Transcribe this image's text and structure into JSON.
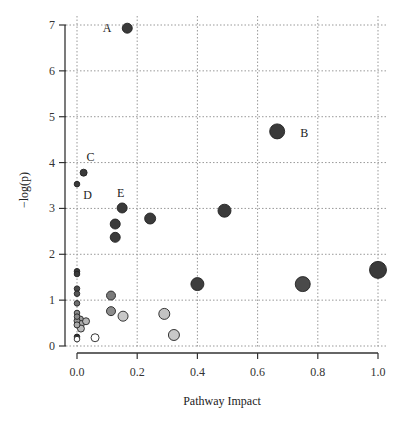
{
  "chart_data": {
    "type": "scatter",
    "title": "",
    "xlabel": "Pathway Impact",
    "ylabel": "−log(p)",
    "xlim": [
      0.0,
      1.0
    ],
    "ylim": [
      0,
      7
    ],
    "xticks": [
      "0.0",
      "0.2",
      "0.4",
      "0.6",
      "0.8",
      "1.0"
    ],
    "yticks": [
      "0",
      "1",
      "2",
      "3",
      "4",
      "5",
      "6",
      "7"
    ],
    "grid": true,
    "legend": null,
    "points": [
      {
        "x": 0.167,
        "y": 6.93,
        "size": 5,
        "color": "#3a3a3a",
        "label": "A"
      },
      {
        "x": 0.665,
        "y": 4.68,
        "size": 7.5,
        "color": "#3a3a3a",
        "label": "B"
      },
      {
        "x": 0.022,
        "y": 3.78,
        "size": 3.5,
        "color": "#3a3a3a",
        "label": "C"
      },
      {
        "x": 0.0,
        "y": 3.53,
        "size": 2.8,
        "color": "#3a3a3a",
        "label": "D"
      },
      {
        "x": 0.15,
        "y": 3.01,
        "size": 5,
        "color": "#3a3a3a",
        "label": "E"
      },
      {
        "x": 0.127,
        "y": 2.66,
        "size": 5,
        "color": "#3a3a3a",
        "label": ""
      },
      {
        "x": 0.127,
        "y": 2.37,
        "size": 5,
        "color": "#3a3a3a",
        "label": ""
      },
      {
        "x": 0.243,
        "y": 2.78,
        "size": 5.5,
        "color": "#3a3a3a",
        "label": ""
      },
      {
        "x": 0.49,
        "y": 2.95,
        "size": 6.5,
        "color": "#3a3a3a",
        "label": ""
      },
      {
        "x": 0.4,
        "y": 1.35,
        "size": 6.5,
        "color": "#3d3d3d",
        "label": ""
      },
      {
        "x": 0.75,
        "y": 1.35,
        "size": 7.5,
        "color": "#4a4a4a",
        "label": ""
      },
      {
        "x": 1.0,
        "y": 1.66,
        "size": 8.5,
        "color": "#3a3a3a",
        "label": ""
      },
      {
        "x": 0.0,
        "y": 1.63,
        "size": 2.8,
        "color": "#3a3a3a",
        "label": ""
      },
      {
        "x": 0.0,
        "y": 1.57,
        "size": 2.8,
        "color": "#3a3a3a",
        "label": ""
      },
      {
        "x": 0.0,
        "y": 1.25,
        "size": 2.8,
        "color": "#4a4a4a",
        "label": ""
      },
      {
        "x": 0.0,
        "y": 1.14,
        "size": 2.8,
        "color": "#555555",
        "label": ""
      },
      {
        "x": 0.0,
        "y": 0.93,
        "size": 2.8,
        "color": "#6e6e6e",
        "label": ""
      },
      {
        "x": 0.0,
        "y": 0.72,
        "size": 2.8,
        "color": "#8a8a8a",
        "label": ""
      },
      {
        "x": 0.0,
        "y": 0.64,
        "size": 2.8,
        "color": "#8a8a8a",
        "label": ""
      },
      {
        "x": 0.0,
        "y": 0.55,
        "size": 3,
        "color": "#999999",
        "label": ""
      },
      {
        "x": 0.0,
        "y": 0.46,
        "size": 3,
        "color": "#aaaaaa",
        "label": ""
      },
      {
        "x": 0.01,
        "y": 0.58,
        "size": 3.5,
        "color": "#9a9a9a",
        "label": ""
      },
      {
        "x": 0.013,
        "y": 0.48,
        "size": 3.5,
        "color": "#aaaaaa",
        "label": ""
      },
      {
        "x": 0.013,
        "y": 0.38,
        "size": 3.5,
        "color": "#bbbbbb",
        "label": ""
      },
      {
        "x": 0.03,
        "y": 0.54,
        "size": 3.5,
        "color": "#b5b5b5",
        "label": ""
      },
      {
        "x": 0.0,
        "y": 0.2,
        "size": 2.8,
        "color": "#2e2e2e",
        "label": ""
      },
      {
        "x": 0.0,
        "y": 0.15,
        "size": 2.8,
        "color": "#ffffff",
        "label": ""
      },
      {
        "x": 0.06,
        "y": 0.18,
        "size": 4,
        "color": "#ffffff",
        "label": ""
      },
      {
        "x": 0.113,
        "y": 1.1,
        "size": 4.5,
        "color": "#7a7a7a",
        "label": ""
      },
      {
        "x": 0.113,
        "y": 0.76,
        "size": 4.5,
        "color": "#8c8c8c",
        "label": ""
      },
      {
        "x": 0.153,
        "y": 0.65,
        "size": 5,
        "color": "#c8c8c8",
        "label": ""
      },
      {
        "x": 0.29,
        "y": 0.7,
        "size": 5.5,
        "color": "#c3c3c3",
        "label": ""
      },
      {
        "x": 0.322,
        "y": 0.24,
        "size": 5.5,
        "color": "#c8c8c8",
        "label": ""
      }
    ],
    "annotations": [
      {
        "text": "A",
        "x": 0.1,
        "y": 6.93
      },
      {
        "text": "B",
        "x": 0.755,
        "y": 4.65
      },
      {
        "text": "C",
        "x": 0.045,
        "y": 4.13
      },
      {
        "text": "D",
        "x": 0.035,
        "y": 3.3
      },
      {
        "text": "E",
        "x": 0.145,
        "y": 3.34
      }
    ]
  },
  "axis": {
    "xlabel": "Pathway Impact",
    "ylabel": "−log(p)"
  },
  "colors": {
    "grid": "#999999",
    "axis": "#333333",
    "point_stroke": "#222222"
  }
}
